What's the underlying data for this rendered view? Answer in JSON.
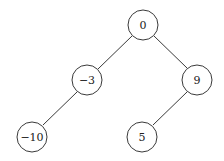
{
  "diagram": {
    "type": "binary-tree",
    "nodes": [
      {
        "id": "n0",
        "label": "0",
        "cx": 143,
        "cy": 25
      },
      {
        "id": "n1",
        "label": "−3",
        "cx": 87,
        "cy": 80
      },
      {
        "id": "n2",
        "label": "9",
        "cx": 197,
        "cy": 80
      },
      {
        "id": "n3",
        "label": "−10",
        "cx": 32,
        "cy": 137
      },
      {
        "id": "n4",
        "label": "5",
        "cx": 142,
        "cy": 137
      }
    ],
    "edges": [
      {
        "from": "n0",
        "to": "n1"
      },
      {
        "from": "n0",
        "to": "n2"
      },
      {
        "from": "n1",
        "to": "n3"
      },
      {
        "from": "n2",
        "to": "n4"
      }
    ],
    "node_radius": 15,
    "colors": {
      "stroke": "#3a3a3a",
      "fill": "#ffffff",
      "text": "#222222"
    }
  }
}
